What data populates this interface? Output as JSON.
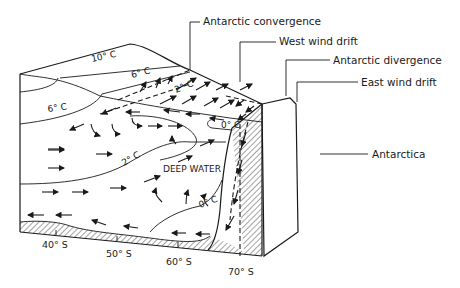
{
  "diagram": {
    "callouts": {
      "antarctic_convergence": "Antarctic convergence",
      "west_wind_drift": "West wind drift",
      "antarctic_divergence": "Antarctic divergence",
      "east_wind_drift": "East wind drift",
      "antarctica": "Antarctica"
    },
    "isotherms": {
      "t10_top": "10° C",
      "t6_top": "6° C",
      "t6_side": "6° C",
      "t2_top": "2° C",
      "t2_side": "2° C",
      "t0_top": "0° C",
      "t0_side": "0° C"
    },
    "water_mass_label": "DEEP WATER",
    "latitudes": [
      "40° S",
      "50° S",
      "60° S",
      "70° S"
    ],
    "colors": {
      "ink": "#1a1a1a",
      "background": "#ffffff"
    }
  }
}
